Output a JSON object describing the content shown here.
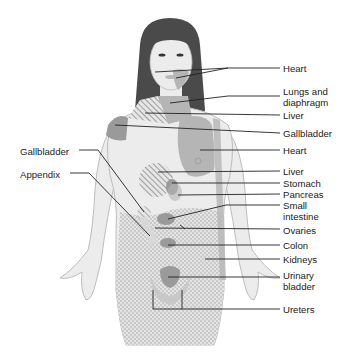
{
  "figure": {
    "type": "referred-pain-anatomical-map"
  },
  "labels_right": [
    {
      "id": "heart-1",
      "text": "Heart",
      "x": 283,
      "y": 63
    },
    {
      "id": "lungs-diaphragm",
      "text": "Lungs and\ndiaphragm",
      "x": 283,
      "y": 86
    },
    {
      "id": "liver-1",
      "text": "Liver",
      "x": 283,
      "y": 110
    },
    {
      "id": "gallbladder-1",
      "text": "Gallbladder",
      "x": 283,
      "y": 128
    },
    {
      "id": "heart-2",
      "text": "Heart",
      "x": 283,
      "y": 145
    },
    {
      "id": "liver-2",
      "text": "Liver",
      "x": 283,
      "y": 166
    },
    {
      "id": "stomach",
      "text": "Stomach",
      "x": 283,
      "y": 178
    },
    {
      "id": "pancreas",
      "text": "Pancreas",
      "x": 283,
      "y": 189
    },
    {
      "id": "small-intestine",
      "text": "Small\nintestine",
      "x": 283,
      "y": 200
    },
    {
      "id": "ovaries",
      "text": "Ovaries",
      "x": 283,
      "y": 225
    },
    {
      "id": "colon",
      "text": "Colon",
      "x": 283,
      "y": 240
    },
    {
      "id": "kidneys",
      "text": "Kidneys",
      "x": 283,
      "y": 254
    },
    {
      "id": "urinary-bladder",
      "text": "Urinary\nbladder",
      "x": 283,
      "y": 270
    },
    {
      "id": "ureters",
      "text": "Ureters",
      "x": 283,
      "y": 304
    }
  ],
  "labels_left": [
    {
      "id": "gallbladder-2",
      "text": "Gallbladder",
      "x": 20,
      "y": 146
    },
    {
      "id": "appendix",
      "text": "Appendix",
      "x": 20,
      "y": 169
    }
  ],
  "colors": {
    "skin": "#ececec",
    "outline": "#bdbdbd",
    "hair": "#4a4a4a",
    "region_dark": "#9a9a9a",
    "region_mid": "#b5b5b5",
    "leader_line": "#222222",
    "text": "#222222"
  }
}
